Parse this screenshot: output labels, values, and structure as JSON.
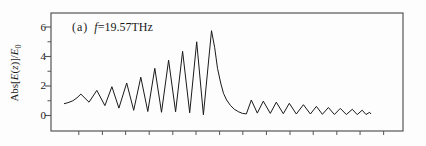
{
  "figure": {
    "panel_label": "(a)",
    "frequency_symbol": "f",
    "frequency_value": "=19.57THz"
  },
  "y_axis": {
    "tick_labels": [
      "6",
      "4",
      "2",
      "0"
    ],
    "label_parts": {
      "abs_open": "Abs[",
      "E1": "E",
      "paren_open": "(",
      "z": "z",
      "close": ")]/",
      "E2": "E",
      "sub_zero": "0"
    }
  },
  "x_axis": {
    "tick_labels": []
  },
  "colors": {
    "background": "#fdfdfd",
    "frame": "#555555",
    "curve": "#1a1a1a",
    "text": "#1a1a1a"
  },
  "chart_data": {
    "type": "line",
    "title": "",
    "annotation": "(a) f=19.57THz",
    "xlabel": "",
    "ylabel": "Abs[E(z)]/E0",
    "grid": false,
    "legend": false,
    "xlim": [
      0,
      100
    ],
    "ylim": [
      -1.05,
      6.95
    ],
    "y_major_ticks": [
      0,
      2,
      4,
      6
    ],
    "y_minor_ticks": [
      1,
      3,
      5
    ],
    "x_minor_ticks_pct": [
      7.9,
      14.6,
      21.2,
      27.9,
      34.6,
      41.2,
      47.9,
      54.5,
      61.2,
      67.9,
      74.5,
      81.2,
      87.8,
      94.5
    ],
    "series": [
      {
        "name": "Abs[E(z)]/E0",
        "color": "#1a1a1a",
        "points": [
          [
            3.7,
            0.8
          ],
          [
            4.8,
            0.87
          ],
          [
            6.2,
            1.0
          ],
          [
            7.4,
            1.2
          ],
          [
            8.5,
            1.45
          ],
          [
            10.8,
            0.9
          ],
          [
            13.0,
            1.7
          ],
          [
            15.3,
            0.67
          ],
          [
            17.3,
            1.95
          ],
          [
            19.3,
            0.5
          ],
          [
            21.5,
            2.2
          ],
          [
            23.5,
            0.35
          ],
          [
            25.5,
            2.6
          ],
          [
            27.5,
            0.27
          ],
          [
            29.5,
            3.2
          ],
          [
            31.4,
            0.22
          ],
          [
            33.4,
            3.75
          ],
          [
            35.4,
            0.25
          ],
          [
            37.4,
            4.35
          ],
          [
            39.4,
            0.18
          ],
          [
            41.4,
            5.0
          ],
          [
            43.3,
            0.05
          ],
          [
            45.6,
            5.75
          ],
          [
            46.5,
            4.6
          ],
          [
            47.3,
            3.2
          ],
          [
            48.2,
            2.2
          ],
          [
            49.0,
            1.5
          ],
          [
            49.9,
            1.05
          ],
          [
            51.0,
            0.68
          ],
          [
            52.1,
            0.42
          ],
          [
            53.3,
            0.25
          ],
          [
            54.4,
            0.14
          ],
          [
            55.5,
            0.11
          ],
          [
            56.9,
            1.05
          ],
          [
            58.6,
            0.16
          ],
          [
            60.3,
            0.97
          ],
          [
            62.3,
            0.14
          ],
          [
            64.0,
            0.9
          ],
          [
            66.0,
            0.12
          ],
          [
            67.7,
            0.83
          ],
          [
            69.7,
            0.1
          ],
          [
            71.7,
            0.73
          ],
          [
            73.7,
            0.1
          ],
          [
            75.4,
            0.62
          ],
          [
            77.1,
            0.08
          ],
          [
            78.8,
            0.54
          ],
          [
            80.5,
            0.07
          ],
          [
            82.2,
            0.48
          ],
          [
            83.9,
            0.07
          ],
          [
            85.6,
            0.42
          ],
          [
            87.0,
            0.06
          ],
          [
            88.4,
            0.36
          ],
          [
            89.5,
            0.07
          ],
          [
            90.5,
            0.22
          ],
          [
            90.9,
            0.1
          ]
        ]
      }
    ]
  }
}
